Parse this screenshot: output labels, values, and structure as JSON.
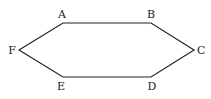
{
  "diagram": {
    "type": "hexagon",
    "stroke_color": "#222222",
    "vertices": [
      {
        "name": "A",
        "x": 63,
        "y": 23,
        "label_x": 62,
        "label_y": 18,
        "anchor": "middle"
      },
      {
        "name": "B",
        "x": 151,
        "y": 23,
        "label_x": 151,
        "label_y": 18,
        "anchor": "middle"
      },
      {
        "name": "C",
        "x": 194,
        "y": 50,
        "label_x": 197,
        "label_y": 54,
        "anchor": "start"
      },
      {
        "name": "D",
        "x": 151,
        "y": 77,
        "label_x": 152,
        "label_y": 90,
        "anchor": "middle"
      },
      {
        "name": "E",
        "x": 63,
        "y": 77,
        "label_x": 61,
        "label_y": 90,
        "anchor": "middle"
      },
      {
        "name": "F",
        "x": 19,
        "y": 50,
        "label_x": 16,
        "label_y": 54,
        "anchor": "end"
      }
    ],
    "labels": {
      "a": "A",
      "b": "B",
      "c": "C",
      "d": "D",
      "e": "E",
      "f": "F"
    }
  }
}
